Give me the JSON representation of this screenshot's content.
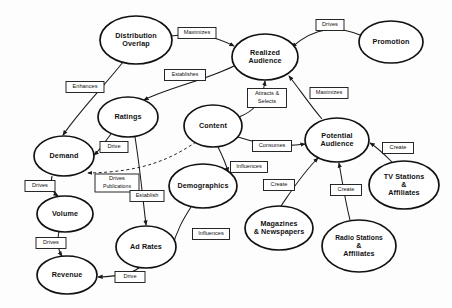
{
  "diagram": {
    "colors": {
      "background": "#fdfdfd",
      "node_stroke": "#111111",
      "node_fill": "#ffffff",
      "edge_stroke": "#1a1a1a",
      "label_text": "#111111"
    },
    "nodes": [
      {
        "id": "distribution-overlap",
        "label_lines": [
          "Distribution",
          "Overlap"
        ],
        "cx": 136,
        "cy": 40,
        "rx": 36,
        "ry": 24
      },
      {
        "id": "realized-audience",
        "label_lines": [
          "Realized",
          "Audience"
        ],
        "cx": 265,
        "cy": 57,
        "rx": 33,
        "ry": 23
      },
      {
        "id": "promotion",
        "label_lines": [
          "Promotion"
        ],
        "cx": 391,
        "cy": 42,
        "rx": 32,
        "ry": 21
      },
      {
        "id": "ratings",
        "label_lines": [
          "Ratings"
        ],
        "cx": 128,
        "cy": 117,
        "rx": 30,
        "ry": 20
      },
      {
        "id": "content",
        "label_lines": [
          "Content"
        ],
        "cx": 213,
        "cy": 126,
        "rx": 29,
        "ry": 21
      },
      {
        "id": "potential-audience",
        "label_lines": [
          "Potential",
          "Audience"
        ],
        "cx": 337,
        "cy": 140,
        "rx": 32,
        "ry": 22
      },
      {
        "id": "demand",
        "label_lines": [
          "Demand"
        ],
        "cx": 64,
        "cy": 156,
        "rx": 30,
        "ry": 20
      },
      {
        "id": "tv-stations",
        "label_lines": [
          "TV Stations",
          "&",
          "Affiliates"
        ],
        "cx": 404,
        "cy": 185,
        "rx": 35,
        "ry": 24
      },
      {
        "id": "demographics",
        "label_lines": [
          "Demographics"
        ],
        "cx": 203,
        "cy": 186,
        "rx": 34,
        "ry": 22
      },
      {
        "id": "volume",
        "label_lines": [
          "Volume"
        ],
        "cx": 65,
        "cy": 214,
        "rx": 28,
        "ry": 18
      },
      {
        "id": "magazines-newspapers",
        "label_lines": [
          "Magazines",
          "& Newspapers"
        ],
        "cx": 279,
        "cy": 228,
        "rx": 34,
        "ry": 22
      },
      {
        "id": "radio-stations",
        "label_lines": [
          "Radio Stations",
          "&",
          "Affiliates"
        ],
        "cx": 359,
        "cy": 246,
        "rx": 37,
        "ry": 26
      },
      {
        "id": "ad-rates",
        "label_lines": [
          "Ad Rates"
        ],
        "cx": 146,
        "cy": 247,
        "rx": 30,
        "ry": 21
      },
      {
        "id": "revenue",
        "label_lines": [
          "Revenue"
        ],
        "cx": 67,
        "cy": 275,
        "rx": 30,
        "ry": 19
      }
    ],
    "edges": [
      {
        "id": "distribution-overlap-to-realized-audience",
        "label": "Maximizes",
        "from": "distribution-overlap",
        "to": "realized-audience",
        "path": "M 171 36 C 196 32 214 36 234 46",
        "lx": 197,
        "ly": 33,
        "lw": 38,
        "lh": 11
      },
      {
        "id": "promotion-to-realized-audience",
        "label": "Drives",
        "from": "promotion",
        "to": "realized-audience",
        "path": "M 360 35 C 338 26 316 26 292 47",
        "lx": 330,
        "ly": 25,
        "lw": 28,
        "lh": 11
      },
      {
        "id": "distribution-overlap-to-demand",
        "label": "Enhances",
        "from": "distribution-overlap",
        "to": "demand",
        "path": "M 123 62 C 106 84 80 110 63 135",
        "lx": 85,
        "ly": 87,
        "lw": 38,
        "lh": 11
      },
      {
        "id": "realized-audience-to-ratings",
        "label": "Establishes",
        "from": "realized-audience",
        "to": "ratings",
        "path": "M 234 66 C 206 80 168 88 144 100",
        "lx": 185,
        "ly": 75,
        "lw": 41,
        "lh": 11
      },
      {
        "id": "content-to-realized-audience",
        "label": "Attracts & Selects",
        "from": "content",
        "to": "realized-audience",
        "path": "M 239 117 C 252 112 262 104 265 81",
        "lx": 267,
        "ly": 98,
        "lw": 39,
        "lh": 19
      },
      {
        "id": "potential-audience-to-realized-audience",
        "label": "Maximizes",
        "from": "potential-audience",
        "to": "realized-audience",
        "path": "M 322 119 C 310 105 300 90 289 76",
        "lx": 329,
        "ly": 93,
        "lw": 38,
        "lh": 11
      },
      {
        "id": "content-to-potential-audience",
        "label": "Consumes",
        "from": "content",
        "to": "potential-audience",
        "path": "M 238 137 C 262 145 285 147 305 144",
        "lx": 272,
        "ly": 146,
        "lw": 39,
        "lh": 11
      },
      {
        "id": "ratings-to-demand",
        "label": "Drive",
        "from": "ratings",
        "to": "demand",
        "path": "M 111 134 C 104 143 100 150 94 155",
        "lx": 114,
        "ly": 147,
        "lw": 28,
        "lh": 11
      },
      {
        "id": "content-to-demand",
        "label": "Drives Publications",
        "from": "content",
        "to": "demand",
        "path": "M 196 142 C 172 158 145 172 88 173",
        "lx": 117,
        "ly": 183,
        "lw": 44,
        "lh": 18,
        "dashed": true
      },
      {
        "id": "content-to-demographics",
        "label": "Influences",
        "from": "content",
        "to": "demographics",
        "path": "M 218 147 C 222 155 226 163 228 172",
        "lx": 249,
        "ly": 167,
        "lw": 37,
        "lh": 11
      },
      {
        "id": "tv-stations-to-potential-audience",
        "label": "Create",
        "from": "tv-stations",
        "to": "potential-audience",
        "path": "M 392 162 C 385 155 378 148 370 143",
        "lx": 398,
        "ly": 148,
        "lw": 31,
        "lh": 11
      },
      {
        "id": "magazines-to-potential-audience",
        "label": "Create",
        "from": "magazines-newspapers",
        "to": "potential-audience",
        "path": "M 281 206 C 292 190 302 174 318 158",
        "lx": 279,
        "ly": 185,
        "lw": 31,
        "lh": 11
      },
      {
        "id": "radio-stations-to-potential-audience",
        "label": "Create",
        "from": "radio-stations",
        "to": "potential-audience",
        "path": "M 350 220 C 345 200 342 180 339 163",
        "lx": 346,
        "ly": 190,
        "lw": 31,
        "lh": 11
      },
      {
        "id": "demand-to-volume",
        "label": "Drives",
        "from": "demand",
        "to": "volume",
        "path": "M 52 176 C 50 185 52 192 58 196",
        "lx": 40,
        "ly": 186,
        "lw": 30,
        "lh": 11
      },
      {
        "id": "ratings-to-ad-rates",
        "label": "Establish",
        "from": "ratings",
        "to": "ad-rates",
        "path": "M 135 137 C 140 168 143 200 146 225",
        "lx": 147,
        "ly": 196,
        "lw": 34,
        "lh": 11
      },
      {
        "id": "demographics-to-ad-rates",
        "label": "Influences",
        "from": "demographics",
        "to": "ad-rates",
        "path": "M 191 207 C 184 218 176 231 172 249",
        "lx": 211,
        "ly": 234,
        "lw": 37,
        "lh": 11
      },
      {
        "id": "volume-to-revenue",
        "label": "Drives",
        "from": "volume",
        "to": "revenue",
        "path": "M 59 231 C 57 240 58 250 62 256",
        "lx": 51,
        "ly": 243,
        "lw": 30,
        "lh": 11
      },
      {
        "id": "ad-rates-to-revenue",
        "label": "Drive",
        "from": "ad-rates",
        "to": "revenue",
        "path": "M 140 267 C 133 273 122 276 98 277",
        "lx": 130,
        "ly": 277,
        "lw": 30,
        "lh": 11
      }
    ]
  }
}
